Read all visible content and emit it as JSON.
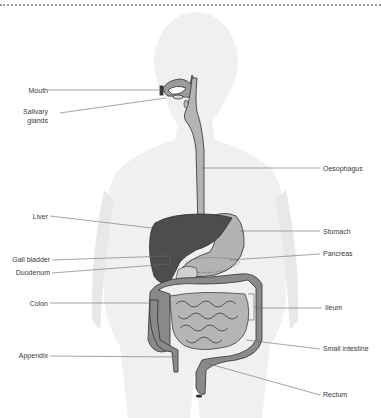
{
  "diagram": {
    "colors": {
      "silhouette": "#f0f0f0",
      "tract_light": "#b8b8b8",
      "tract_mid": "#8c8c8c",
      "organ_dark": "#4d4d4d",
      "outline": "#2e2e2e",
      "leader_line": "#6a6a6a",
      "label_text": "#3a3a3a"
    },
    "labels_left": [
      {
        "id": "mouth",
        "text": "Mouth"
      },
      {
        "id": "salivary_line1",
        "text": "Salivary"
      },
      {
        "id": "salivary_line2",
        "text": "glands"
      },
      {
        "id": "liver",
        "text": "Liver"
      },
      {
        "id": "gall_bladder",
        "text": "Gall bladder"
      },
      {
        "id": "duodenum",
        "text": "Duodenum"
      },
      {
        "id": "colon",
        "text": "Colon"
      },
      {
        "id": "appendix",
        "text": "Appendix"
      }
    ],
    "labels_right": [
      {
        "id": "oesophagus",
        "text": "Oesophagus"
      },
      {
        "id": "stomach",
        "text": "Stomach"
      },
      {
        "id": "pancreas",
        "text": "Pancreas"
      },
      {
        "id": "ileum",
        "text": "Ileum"
      },
      {
        "id": "small_intestine",
        "text": "Small intestine"
      },
      {
        "id": "rectum",
        "text": "Rectum"
      }
    ]
  }
}
